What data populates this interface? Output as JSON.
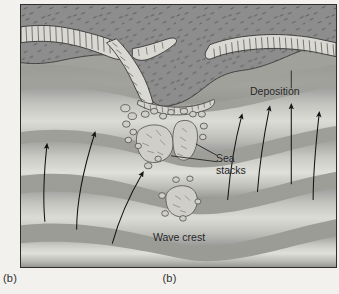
{
  "figure": {
    "caption_left": "(b)",
    "caption_center": "(b)",
    "labels": {
      "deposition": "Deposition",
      "sea_stacks_line1": "Sea",
      "sea_stacks_line2": "stacks",
      "wave_crest": "Wave crest"
    }
  },
  "colors": {
    "page_background": "#f2f1ee",
    "frame_border": "#2e2e2e",
    "land_dark": "#8d8d8d",
    "land_vegetation_tick": "#4a4a4a",
    "cliff_face_light": "#d8d7d2",
    "cliff_line": "#3a3a3a",
    "water_band_light": "#d2d2cd",
    "water_band_dark": "#9a9a9a",
    "arrow_stroke": "#1b1b1b",
    "stack_outline": "#55554f",
    "label_text": "#23231f"
  },
  "diagram": {
    "type": "geology-cross-section",
    "arrow_count_left": 3,
    "arrow_count_right": 4,
    "wave_band_count": 5
  }
}
